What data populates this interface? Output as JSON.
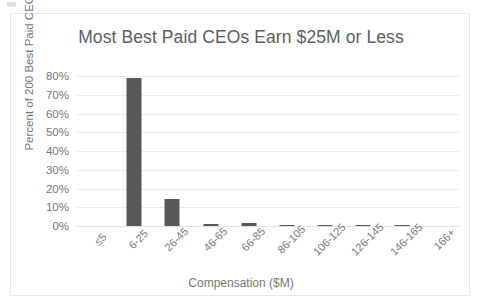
{
  "chart_data": {
    "type": "bar",
    "title": "Most Best Paid CEOs Earn $25M or Less",
    "xlabel": "Compensation ($M)",
    "ylabel": "Percent of 200 Best Paid CEOs",
    "categories": [
      "≤5",
      "6-25",
      "26-45",
      "46-65",
      "66-85",
      "86-105",
      "106-125",
      "126-145",
      "146-165",
      "166+"
    ],
    "values": [
      0,
      79,
      14.5,
      1,
      1.5,
      0.5,
      0.5,
      0.5,
      0.5,
      0
    ],
    "ylim": [
      0,
      80
    ],
    "yticks": [
      0,
      10,
      20,
      30,
      40,
      50,
      60,
      70,
      80
    ],
    "ytick_labels": [
      "0%",
      "10%",
      "20%",
      "30%",
      "40%",
      "50%",
      "60%",
      "70%",
      "80%"
    ],
    "grid": true,
    "legend": false,
    "bar_color": "#58585a",
    "grid_color": "#ececed",
    "text_color": "#77777a",
    "title_color": "#5e5e60",
    "background": "#ffffff"
  }
}
